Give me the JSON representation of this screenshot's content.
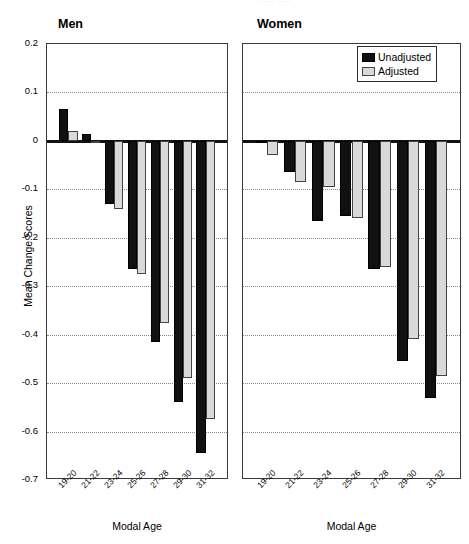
{
  "figure": {
    "clipped_title": "·· ···· ·····",
    "y_axis_label": "Mean Change Scores",
    "x_axis_label": "Modal Age",
    "colors": {
      "unadjusted": "#111111",
      "adjusted": "#d9d9d9",
      "axis": "#3a3a3a",
      "grid": "#8a8a8a"
    }
  },
  "legend": {
    "position": "top-right",
    "entries": [
      {
        "label": "Unadjusted",
        "color": "#111111"
      },
      {
        "label": "Adjusted",
        "color": "#d9d9d9"
      }
    ]
  },
  "panels": [
    {
      "id": "men",
      "title": "Men",
      "xlabel": "Modal Age"
    },
    {
      "id": "women",
      "title": "Women",
      "xlabel": "Modal Age"
    }
  ],
  "y_ticks": [
    "0.2",
    "0.1",
    "0",
    "-0.1",
    "-0.2",
    "-0.3",
    "-0.4",
    "-0.5",
    "-0.6",
    "-0.7"
  ],
  "x_ticks": [
    "19-20",
    "21-22",
    "23-24",
    "25-26",
    "27-28",
    "29-30",
    "31-32"
  ],
  "chart_data": {
    "type": "bar",
    "title": "",
    "xlabel": "Modal Age",
    "ylabel": "Mean Change Scores",
    "ylim": [
      -0.7,
      0.2
    ],
    "ytick_step": 0.1,
    "grid": true,
    "legend_position": "top-right",
    "panels": [
      {
        "name": "Men",
        "categories": [
          "19-20",
          "21-22",
          "23-24",
          "25-26",
          "27-28",
          "29-30",
          "31-32"
        ],
        "series": [
          {
            "name": "Unadjusted",
            "values": [
              0.065,
              0.015,
              -0.13,
              -0.265,
              -0.415,
              -0.54,
              -0.645
            ]
          },
          {
            "name": "Adjusted",
            "values": [
              0.02,
              -0.005,
              -0.14,
              -0.275,
              -0.375,
              -0.49,
              -0.575
            ]
          }
        ]
      },
      {
        "name": "Women",
        "categories": [
          "19-20",
          "21-22",
          "23-24",
          "25-26",
          "27-28",
          "29-30",
          "31-32"
        ],
        "series": [
          {
            "name": "Unadjusted",
            "values": [
              -0.005,
              -0.065,
              -0.165,
              -0.155,
              -0.265,
              -0.455,
              -0.53
            ]
          },
          {
            "name": "Adjusted",
            "values": [
              -0.03,
              -0.085,
              -0.095,
              -0.16,
              -0.26,
              -0.41,
              -0.485
            ]
          }
        ]
      }
    ]
  }
}
